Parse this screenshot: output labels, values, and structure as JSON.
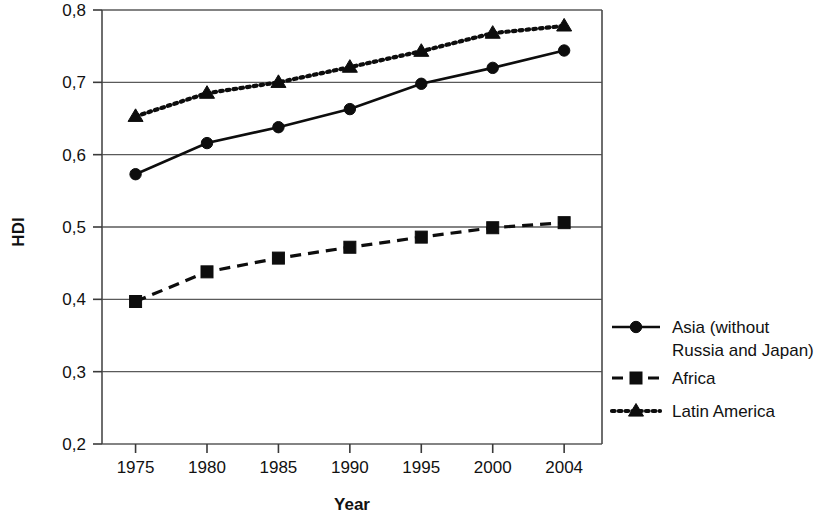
{
  "chart_data": {
    "type": "line",
    "title": "",
    "xlabel": "Year",
    "ylabel": "HDI",
    "categories": [
      "1975",
      "1980",
      "1985",
      "1990",
      "1995",
      "2000",
      "2004"
    ],
    "x_tick_labels": [
      "1975",
      "1980",
      "1985",
      "1990",
      "1995",
      "2000",
      "2004"
    ],
    "y_tick_labels": [
      "0,2",
      "0,3",
      "0,4",
      "0,5",
      "0,6",
      "0,7",
      "0,8"
    ],
    "y_tick_values": [
      0.2,
      0.3,
      0.4,
      0.5,
      0.6,
      0.7,
      0.8
    ],
    "ylim": [
      0.2,
      0.8
    ],
    "grid": "horizontal",
    "legend_position": "right",
    "decimal_separator": ",",
    "series": [
      {
        "name": "Asia (without Russia and Japan)",
        "legend_lines": [
          "Asia (without",
          "Russia and Japan)"
        ],
        "marker": "circle",
        "linestyle": "solid",
        "color": "#0d0d0d",
        "values": [
          0.573,
          0.616,
          0.638,
          0.663,
          0.698,
          0.72,
          0.744
        ]
      },
      {
        "name": "Africa",
        "legend_lines": [
          "Africa"
        ],
        "marker": "square",
        "linestyle": "dashed",
        "color": "#0d0d0d",
        "values": [
          0.397,
          0.438,
          0.457,
          0.472,
          0.486,
          0.499,
          0.506
        ]
      },
      {
        "name": "Latin America",
        "legend_lines": [
          "Latin America"
        ],
        "marker": "triangle",
        "linestyle": "dotted",
        "color": "#0d0d0d",
        "values": [
          0.653,
          0.685,
          0.7,
          0.721,
          0.743,
          0.768,
          0.778
        ]
      }
    ]
  },
  "legend": {
    "entries": [
      {
        "label": "Asia (without Russia and Japan)",
        "lines": [
          "Asia (without",
          "Russia and Japan)"
        ],
        "marker": "circle",
        "linestyle": "solid"
      },
      {
        "label": "Africa",
        "lines": [
          "Africa"
        ],
        "marker": "square",
        "linestyle": "dashed"
      },
      {
        "label": "Latin America",
        "lines": [
          "Latin America"
        ],
        "marker": "triangle",
        "linestyle": "dotted"
      }
    ]
  }
}
